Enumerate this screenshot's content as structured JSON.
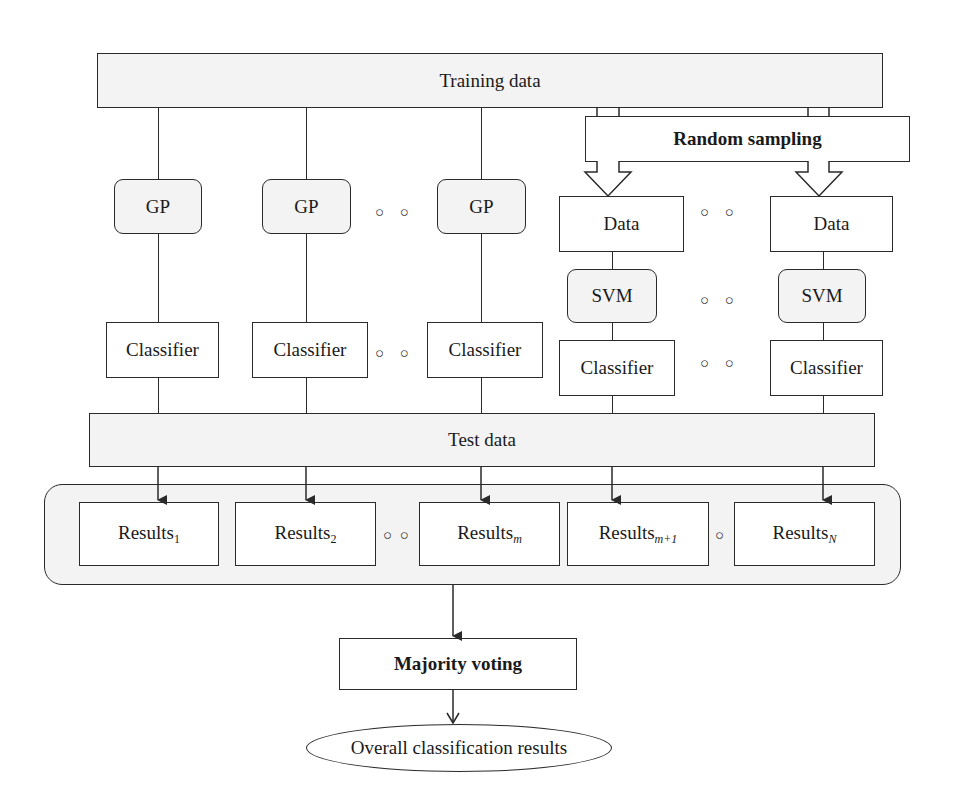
{
  "diagram": {
    "training_data": "Training data",
    "random_sampling": "Random sampling",
    "gp_label": "GP",
    "data_label": "Data",
    "svm_label": "SVM",
    "classifier_label": "Classifier",
    "test_data": "Test data",
    "ellipsis": "○ ○",
    "single_dot": "○",
    "results": [
      {
        "base": "Results",
        "sub": "1",
        "italic": false
      },
      {
        "base": "Results",
        "sub": "2",
        "italic": false
      },
      {
        "base": "Results",
        "sub": "m",
        "italic": true
      },
      {
        "base": "Results",
        "sub": "m+1",
        "italic": true
      },
      {
        "base": "Results",
        "sub": "N",
        "italic": true
      }
    ],
    "majority_voting": "Majority voting",
    "overall_results": "Overall classification results"
  },
  "colors": {
    "stroke": "#2a2a2a",
    "shaded_fill": "#f3f3f3",
    "background": "#ffffff"
  }
}
